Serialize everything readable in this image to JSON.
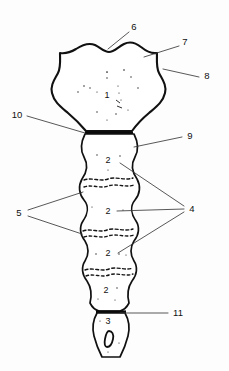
{
  "figure": {
    "background_color": "#fdfdfd",
    "outline_color": "#111111",
    "leader_color": "#3a3a3a",
    "width": 229,
    "height": 371
  },
  "callouts": [
    {
      "id": "callout-6",
      "label": "6",
      "x": 134,
      "y": 27,
      "target_x": 108,
      "target_y": 49
    },
    {
      "id": "callout-7",
      "label": "7",
      "x": 185,
      "y": 42,
      "target_x": 144,
      "target_y": 57
    },
    {
      "id": "callout-8",
      "label": "8",
      "x": 207,
      "y": 76,
      "target_x": 163,
      "target_y": 69
    },
    {
      "id": "callout-9",
      "label": "9",
      "x": 190,
      "y": 136,
      "target_x": 134,
      "target_y": 146
    },
    {
      "id": "callout-10",
      "label": "10",
      "x": 17,
      "y": 115,
      "target_x": 85,
      "target_y": 133
    },
    {
      "id": "callout-11",
      "label": "11",
      "x": 178,
      "y": 313,
      "target_x": 120,
      "target_y": 313
    },
    {
      "id": "callout-5",
      "label": "5",
      "x": 19,
      "y": 213,
      "target_x": 83,
      "target_y": 193
    },
    {
      "id": "callout-4",
      "label": "4",
      "x": 192,
      "y": 209,
      "target_x": 122,
      "target_y": 163
    }
  ],
  "inner_labels": [
    {
      "id": "segment-label-1",
      "label": "1",
      "x": 107,
      "y": 96
    },
    {
      "id": "segment-label-2a",
      "label": "2",
      "x": 108,
      "y": 161
    },
    {
      "id": "segment-label-2b",
      "label": "2",
      "x": 108,
      "y": 212
    },
    {
      "id": "segment-label-2c",
      "label": "2",
      "x": 108,
      "y": 254
    },
    {
      "id": "segment-label-2d",
      "label": "2",
      "x": 106,
      "y": 291
    },
    {
      "id": "segment-label-3",
      "label": "3",
      "x": 108,
      "y": 322
    }
  ],
  "legend_note": {
    "numbers_present": [
      "1",
      "2",
      "3",
      "4",
      "5",
      "6",
      "7",
      "8",
      "9",
      "10",
      "11"
    ]
  }
}
